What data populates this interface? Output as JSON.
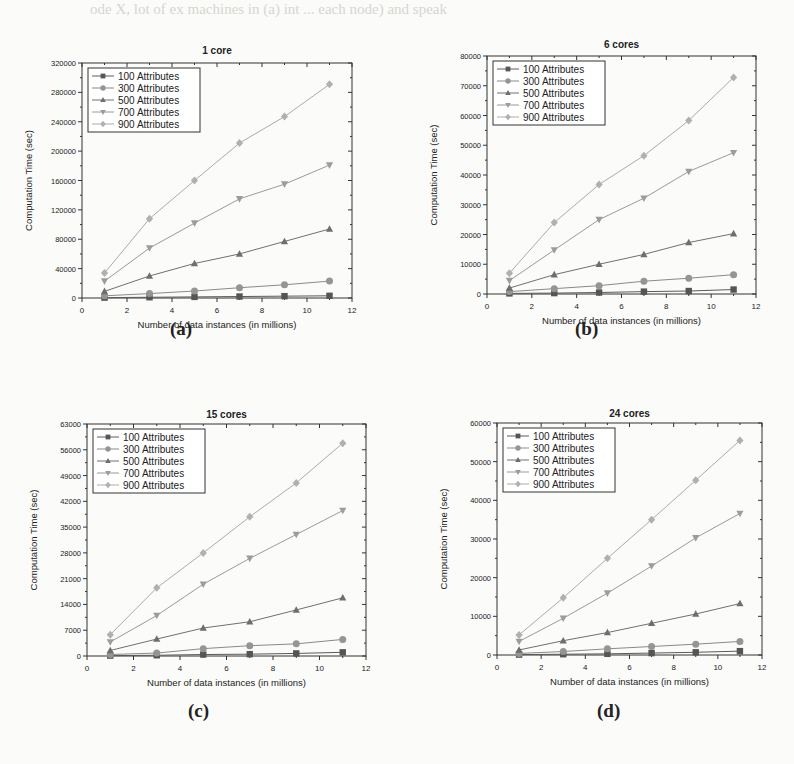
{
  "bleed_text": "ode X, lot of ex machines in (a) int ... each node) and speak",
  "chart_data": [
    {
      "type": "line",
      "panel": "a",
      "title": "1 core",
      "caption": "(a)",
      "xlabel": "Number of data instances (in millions)",
      "ylabel": "Computation Time (sec)",
      "xlim": [
        0,
        12
      ],
      "ylim": [
        0,
        320000
      ],
      "xticks": [
        0,
        2,
        4,
        6,
        8,
        10,
        12
      ],
      "yticks": [
        0,
        40000,
        80000,
        120000,
        160000,
        200000,
        240000,
        280000,
        320000
      ],
      "x": [
        1,
        3,
        5,
        7,
        9,
        11
      ],
      "legend_position": "upper left",
      "grid": false,
      "series": [
        {
          "name": "100 Attributes",
          "marker": "square",
          "values": [
            500,
            1000,
            1500,
            2000,
            2500,
            3000
          ]
        },
        {
          "name": "300 Attributes",
          "marker": "circle",
          "values": [
            3000,
            6000,
            9500,
            14000,
            18000,
            23000
          ]
        },
        {
          "name": "500 Attributes",
          "marker": "triangle-up",
          "values": [
            9000,
            30000,
            47000,
            60000,
            77000,
            94000
          ]
        },
        {
          "name": "700 Attributes",
          "marker": "triangle-down",
          "values": [
            23000,
            68000,
            102000,
            135000,
            155000,
            181000
          ]
        },
        {
          "name": "900 Attributes",
          "marker": "diamond",
          "values": [
            34000,
            108000,
            160000,
            211000,
            247000,
            291000
          ]
        }
      ]
    },
    {
      "type": "line",
      "panel": "b",
      "title": "6 cores",
      "caption": "(b)",
      "xlabel": "Number of data instances (in millions)",
      "ylabel": "Computation Time (sec)",
      "xlim": [
        0,
        12
      ],
      "ylim": [
        0,
        80000
      ],
      "xticks": [
        0,
        2,
        4,
        6,
        8,
        10,
        12
      ],
      "yticks": [
        0,
        10000,
        20000,
        30000,
        40000,
        50000,
        60000,
        70000,
        80000
      ],
      "x": [
        1,
        3,
        5,
        7,
        9,
        11
      ],
      "legend_position": "upper left",
      "grid": false,
      "series": [
        {
          "name": "100 Attributes",
          "marker": "square",
          "values": [
            200,
            300,
            500,
            800,
            1000,
            1500
          ]
        },
        {
          "name": "300 Attributes",
          "marker": "circle",
          "values": [
            800,
            1800,
            2800,
            4300,
            5300,
            6500
          ]
        },
        {
          "name": "500 Attributes",
          "marker": "triangle-up",
          "values": [
            2000,
            6500,
            10000,
            13300,
            17300,
            20300
          ]
        },
        {
          "name": "700 Attributes",
          "marker": "triangle-down",
          "values": [
            4500,
            14800,
            25000,
            32200,
            41200,
            47500
          ]
        },
        {
          "name": "900 Attributes",
          "marker": "diamond",
          "values": [
            7000,
            24000,
            36800,
            46500,
            58300,
            72800
          ]
        }
      ]
    },
    {
      "type": "line",
      "panel": "c",
      "title": "15 cores",
      "caption": "(c)",
      "xlabel": "Number of data instances (in millions)",
      "ylabel": "Computation Time (sec)",
      "xlim": [
        0,
        12
      ],
      "ylim": [
        0,
        63000
      ],
      "xticks": [
        0,
        2,
        4,
        6,
        8,
        10,
        12
      ],
      "yticks": [
        0,
        7000,
        14000,
        21000,
        28000,
        35000,
        42000,
        49000,
        56000,
        63000
      ],
      "x": [
        1,
        3,
        5,
        7,
        9,
        11
      ],
      "legend_position": "upper left",
      "grid": false,
      "series": [
        {
          "name": "100 Attributes",
          "marker": "square",
          "values": [
            100,
            200,
            400,
            500,
            700,
            1000
          ]
        },
        {
          "name": "300 Attributes",
          "marker": "circle",
          "values": [
            400,
            800,
            2000,
            2800,
            3300,
            4500
          ]
        },
        {
          "name": "500 Attributes",
          "marker": "triangle-up",
          "values": [
            1500,
            4600,
            7600,
            9300,
            12500,
            15800
          ]
        },
        {
          "name": "700 Attributes",
          "marker": "triangle-down",
          "values": [
            3800,
            11000,
            19500,
            26500,
            33000,
            39500
          ]
        },
        {
          "name": "900 Attributes",
          "marker": "diamond",
          "values": [
            5800,
            18500,
            28000,
            37800,
            47000,
            57800
          ]
        }
      ]
    },
    {
      "type": "line",
      "panel": "d",
      "title": "24 cores",
      "caption": "(d)",
      "xlabel": "Number of data instances (in millions)",
      "ylabel": "Computation Time (sec)",
      "xlim": [
        0,
        12
      ],
      "ylim": [
        0,
        60000
      ],
      "xticks": [
        0,
        2,
        4,
        6,
        8,
        10,
        12
      ],
      "yticks": [
        0,
        10000,
        20000,
        30000,
        40000,
        50000,
        60000
      ],
      "x": [
        1,
        3,
        5,
        7,
        9,
        11
      ],
      "legend_position": "upper left",
      "grid": false,
      "series": [
        {
          "name": "100 Attributes",
          "marker": "square",
          "values": [
            100,
            200,
            300,
            500,
            700,
            1000
          ]
        },
        {
          "name": "300 Attributes",
          "marker": "circle",
          "values": [
            400,
            900,
            1600,
            2200,
            2800,
            3500
          ]
        },
        {
          "name": "500 Attributes",
          "marker": "triangle-up",
          "values": [
            1300,
            3700,
            5800,
            8200,
            10600,
            13300
          ]
        },
        {
          "name": "700 Attributes",
          "marker": "triangle-down",
          "values": [
            3500,
            9500,
            16000,
            23000,
            30300,
            36600
          ]
        },
        {
          "name": "900 Attributes",
          "marker": "diamond",
          "values": [
            5200,
            14800,
            25000,
            35000,
            45200,
            55500
          ]
        }
      ]
    }
  ],
  "layout": {
    "panels": [
      {
        "left": 82,
        "top": 63,
        "width": 270,
        "height": 235,
        "caption_x": 185,
        "caption_y": 330,
        "title_y": 44
      },
      {
        "left": 487,
        "top": 56,
        "width": 269,
        "height": 238,
        "caption_x": 590,
        "caption_y": 330,
        "title_y": 38
      },
      {
        "left": 87,
        "top": 424,
        "width": 279,
        "height": 232,
        "caption_x": 203,
        "caption_y": 712,
        "title_y": 408
      },
      {
        "left": 497,
        "top": 423,
        "width": 265,
        "height": 232,
        "caption_x": 612,
        "caption_y": 712,
        "title_y": 407
      }
    ],
    "colors": {
      "axis": "#333333",
      "text": "#222222",
      "series": [
        "#5a5a5a",
        "#8a8a8a",
        "#707070",
        "#9a9a9a",
        "#ababab"
      ],
      "marker_fill": [
        "#555555",
        "#959595",
        "#6e6e6e",
        "#9c9c9c",
        "#b0b0b0"
      ]
    }
  }
}
